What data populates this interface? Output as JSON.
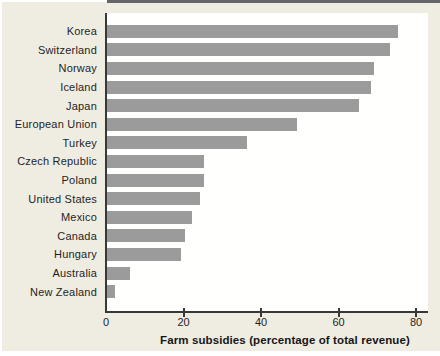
{
  "chart_data": {
    "type": "bar",
    "orientation": "horizontal",
    "title": "",
    "xlabel": "Farm subsidies (percentage of total revenue)",
    "ylabel": "",
    "categories": [
      "Korea",
      "Switzerland",
      "Norway",
      "Iceland",
      "Japan",
      "European Union",
      "Turkey",
      "Czech Republic",
      "Poland",
      "United States",
      "Mexico",
      "Canada",
      "Hungary",
      "Australia",
      "New Zealand"
    ],
    "values": [
      75,
      73,
      69,
      68,
      65,
      49,
      36,
      25,
      25,
      24,
      22,
      20,
      19,
      6,
      2
    ],
    "xticks": [
      0,
      20,
      40,
      60,
      80
    ],
    "xlim": [
      0,
      83
    ],
    "grid": false,
    "legend": null,
    "colors": {
      "bar": "#9b9b9b",
      "axis": "#383838",
      "text": "#1f1f1f",
      "panel_background": "#efece2",
      "plot_background": "#fffffe",
      "top_rule": "#64676a"
    }
  }
}
